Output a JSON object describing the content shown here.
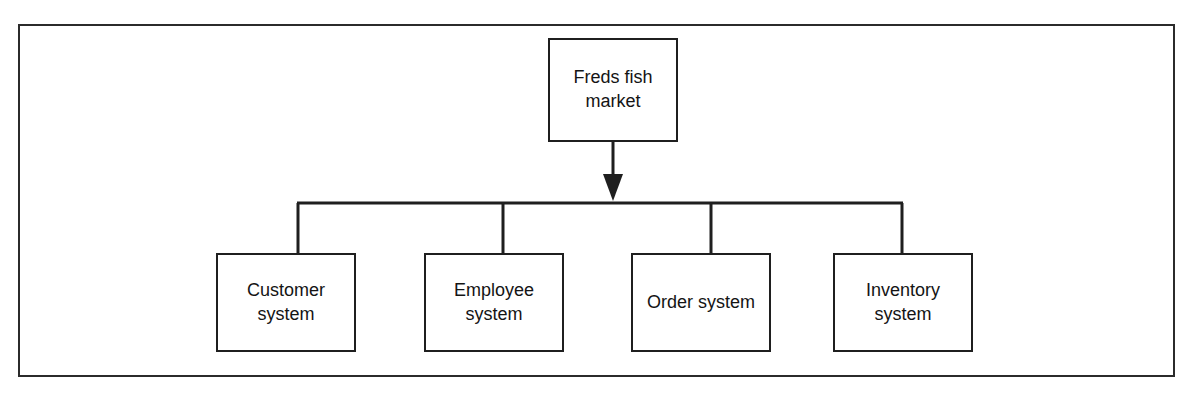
{
  "figure": {
    "type": "hierarchy-decomposition-diagram",
    "orientation": "top-down",
    "frame_border_color": "#2b2b2b",
    "node_border_color": "#1f1f1f",
    "line_color": "#1f1f1f",
    "background_color": "#ffffff",
    "clipped_header_text": "",
    "root": {
      "id": "root",
      "label": "Freds fish market"
    },
    "children": [
      {
        "id": "customer-system",
        "label": "Customer system"
      },
      {
        "id": "employee-system",
        "label": "Employee system"
      },
      {
        "id": "order-system",
        "label": "Order system"
      },
      {
        "id": "inventory-system",
        "label": "Inventory system"
      }
    ],
    "connector": {
      "style": "bus-with-single-arrow",
      "arrow_from": "root",
      "arrow_to": "bus-line",
      "arrowhead": "filled-triangle-down",
      "bus_branches": 4
    }
  }
}
